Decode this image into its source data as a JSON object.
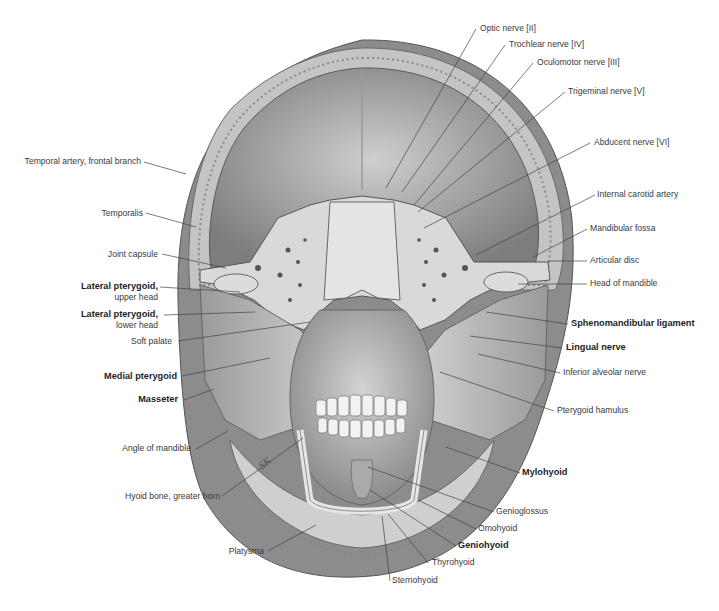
{
  "figure": {
    "engraving_initials": "SK",
    "colors": {
      "background": "#ffffff",
      "text": "#3a3a3a",
      "text_bold": "#1e1e1e",
      "leader": "#444444",
      "bone": "#d8d8d8",
      "muscle": "#b9b9b9",
      "shadow": "#6e6e6e"
    }
  },
  "labels_left": [
    {
      "id": "temporal-artery-frontal-branch",
      "text": "Temporal artery, frontal branch",
      "bold": false
    },
    {
      "id": "temporalis",
      "text": "Temporalis",
      "bold": false
    },
    {
      "id": "joint-capsule",
      "text": "Joint capsule",
      "bold": false
    },
    {
      "id": "lateral-pterygoid-upper",
      "text": "Lateral pterygoid,",
      "sub": "upper head",
      "bold": true
    },
    {
      "id": "lateral-pterygoid-lower",
      "text": "Lateral pterygoid,",
      "sub": "lower head",
      "bold": true
    },
    {
      "id": "soft-palate",
      "text": "Soft palate",
      "bold": false
    },
    {
      "id": "medial-pterygoid",
      "text": "Medial pterygoid",
      "bold": true
    },
    {
      "id": "masseter",
      "text": "Masseter",
      "bold": true
    },
    {
      "id": "angle-of-mandible",
      "text": "Angle of mandible",
      "bold": false
    },
    {
      "id": "hyoid-greater-horn",
      "text": "Hyoid bone, greater horn",
      "bold": false
    },
    {
      "id": "platysma",
      "text": "Platysma",
      "bold": false
    }
  ],
  "labels_right": [
    {
      "id": "optic-nerve",
      "text": "Optic nerve [II]",
      "bold": false
    },
    {
      "id": "trochlear-nerve",
      "text": "Trochlear nerve [IV]",
      "bold": false
    },
    {
      "id": "oculomotor-nerve",
      "text": "Oculomotor nerve [III]",
      "bold": false
    },
    {
      "id": "trigeminal-nerve",
      "text": "Trigeminal nerve [V]",
      "bold": false
    },
    {
      "id": "abducent-nerve",
      "text": "Abducent nerve [VI]",
      "bold": false
    },
    {
      "id": "internal-carotid-artery",
      "text": "Internal carotid artery",
      "bold": false
    },
    {
      "id": "mandibular-fossa",
      "text": "Mandibular fossa",
      "bold": false
    },
    {
      "id": "articular-disc",
      "text": "Articular disc",
      "bold": false
    },
    {
      "id": "head-of-mandible",
      "text": "Head of mandible",
      "bold": false
    },
    {
      "id": "sphenomandibular-ligament",
      "text": "Sphenomandibular ligament",
      "bold": true
    },
    {
      "id": "lingual-nerve",
      "text": "Lingual nerve",
      "bold": true
    },
    {
      "id": "inferior-alveolar-nerve",
      "text": "Inferior alveolar nerve",
      "bold": false
    },
    {
      "id": "pterygoid-hamulus",
      "text": "Pterygoid hamulus",
      "bold": false
    },
    {
      "id": "mylohyoid",
      "text": "Mylohyoid",
      "bold": true
    },
    {
      "id": "genioglossus",
      "text": "Genioglossus",
      "bold": false
    },
    {
      "id": "omohyoid",
      "text": "Omohyoid",
      "bold": false
    },
    {
      "id": "geniohyoid",
      "text": "Geniohyoid",
      "bold": true
    },
    {
      "id": "thyrohyoid",
      "text": "Thyrohyoid",
      "bold": false
    },
    {
      "id": "sternohyoid",
      "text": "Sternohyoid",
      "bold": false
    }
  ]
}
